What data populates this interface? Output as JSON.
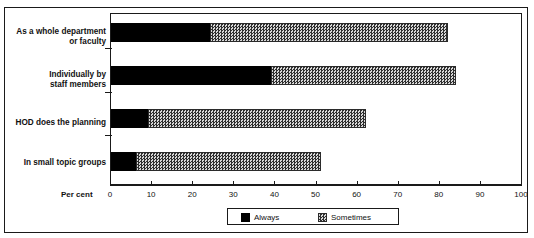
{
  "figure": {
    "top_fragment": "",
    "axis_title": "Per cent"
  },
  "legend": {
    "items": [
      {
        "label": "Always",
        "swatch": "solid-black-swatch",
        "color": "#000000"
      },
      {
        "label": "Sometimes",
        "swatch": "checkered-gray-swatch",
        "color": "#bdbdbd"
      }
    ]
  },
  "chart_data": {
    "type": "bar",
    "orientation": "horizontal",
    "stacked": true,
    "title": "",
    "xlabel": "Per cent",
    "ylabel": "",
    "xlim": [
      0,
      100
    ],
    "xticks": [
      0,
      10,
      20,
      30,
      40,
      50,
      60,
      70,
      80,
      90,
      100
    ],
    "xtick_labels": [
      "0",
      "10",
      "20",
      "30",
      "40",
      "50",
      "60",
      "70",
      "80",
      "90",
      "100"
    ],
    "grid": false,
    "legend_position": "bottom",
    "categories": [
      "As a whole department\nor faculty",
      "Individually by\nstaff members",
      "HOD does the planning",
      "In small topic groups"
    ],
    "series": [
      {
        "name": "Always",
        "values": [
          24,
          39,
          9,
          6
        ]
      },
      {
        "name": "Sometimes",
        "values": [
          58,
          45,
          53,
          45
        ]
      }
    ],
    "cumulative_totals": [
      82,
      84,
      62,
      51
    ]
  }
}
